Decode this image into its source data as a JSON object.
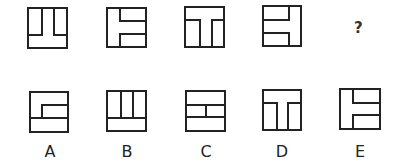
{
  "sequence": {
    "figures": [
      {
        "id": "fig1",
        "description": "square with two upward pillars (left and right) ending at lower third",
        "box": [
          28,
          8,
          39,
          40
        ],
        "lines": [
          [
            42,
            8,
            42,
            35
          ],
          [
            28,
            35,
            42,
            35
          ],
          [
            54,
            8,
            54,
            35
          ],
          [
            54,
            35,
            67,
            35
          ]
        ]
      },
      {
        "id": "fig2",
        "description": "square with vertical line at left third and two horizontal arms to the right",
        "box": [
          107,
          8,
          39,
          39
        ],
        "lines": [
          [
            120,
            8,
            120,
            21
          ],
          [
            120,
            21,
            146,
            21
          ],
          [
            120,
            34,
            146,
            34
          ],
          [
            120,
            34,
            120,
            47
          ]
        ]
      },
      {
        "id": "fig3",
        "description": "square with horizontal top bar and two downward pillars (T shape)",
        "box": [
          185,
          7,
          39,
          40
        ],
        "lines": [
          [
            185,
            20,
            200,
            20
          ],
          [
            200,
            20,
            200,
            47
          ],
          [
            212,
            20,
            224,
            20
          ],
          [
            212,
            20,
            212,
            47
          ]
        ]
      },
      {
        "id": "fig4",
        "description": "square with vertical line at right third and two horizontal arms to the left",
        "box": [
          263,
          6,
          38,
          40
        ],
        "lines": [
          [
            289,
            6,
            289,
            20
          ],
          [
            263,
            20,
            289,
            20
          ],
          [
            263,
            33,
            289,
            33
          ],
          [
            289,
            33,
            289,
            46
          ]
        ]
      }
    ],
    "question_mark": "?"
  },
  "options": [
    {
      "label": "A",
      "box": [
        30,
        92,
        38,
        40
      ],
      "lines": [
        [
          42,
          105,
          68,
          105
        ],
        [
          42,
          105,
          42,
          118
        ],
        [
          30,
          118,
          68,
          118
        ]
      ],
      "label_pos": [
        40,
        142
      ]
    },
    {
      "label": "B",
      "box": [
        107,
        91,
        39,
        40
      ],
      "lines": [
        [
          121,
          91,
          121,
          118
        ],
        [
          107,
          118,
          121,
          118
        ],
        [
          133,
          91,
          133,
          118
        ],
        [
          133,
          118,
          146,
          118
        ],
        [
          107,
          118,
          146,
          118
        ]
      ],
      "label_pos": [
        117,
        142
      ]
    },
    {
      "label": "C",
      "box": [
        186,
        91,
        39,
        40
      ],
      "lines": [
        [
          186,
          105,
          225,
          105
        ],
        [
          186,
          117,
          225,
          117
        ],
        [
          206,
          105,
          206,
          117
        ]
      ],
      "label_pos": [
        196,
        142
      ]
    },
    {
      "label": "D",
      "box": [
        263,
        90,
        38,
        40
      ],
      "lines": [
        [
          263,
          103,
          277,
          103
        ],
        [
          277,
          103,
          277,
          130
        ],
        [
          288,
          103,
          301,
          103
        ],
        [
          288,
          103,
          288,
          130
        ]
      ],
      "label_pos": [
        272,
        142
      ]
    },
    {
      "label": "E",
      "box": [
        340,
        89,
        40,
        40
      ],
      "lines": [
        [
          353,
          89,
          353,
          103
        ],
        [
          353,
          103,
          380,
          103
        ],
        [
          353,
          115,
          380,
          115
        ],
        [
          353,
          115,
          353,
          129
        ]
      ],
      "label_pos": [
        350,
        142
      ]
    }
  ]
}
